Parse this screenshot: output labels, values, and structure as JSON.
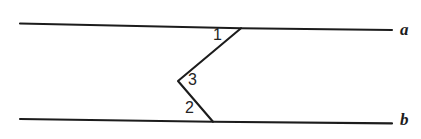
{
  "figure": {
    "background_color": "#ffffff",
    "stroke_color": "#1c1c1c",
    "stroke_width": 2.1,
    "width": 421,
    "height": 139,
    "lines": [
      {
        "name": "line-a",
        "label": "a",
        "label_style": "italic",
        "points": "20,23.5 241,28.2 392,30.0"
      },
      {
        "name": "line-b",
        "label": "b",
        "label_style": "italic",
        "points": "20,119.0 213,121.8 392,123.4"
      },
      {
        "name": "transversal-zigzag",
        "label": "",
        "label_style": "none",
        "points": "241,28.2 178,81.0 213,121.8"
      }
    ],
    "angles": [
      {
        "name": "angle-1",
        "label": "1",
        "vertex_x": 241,
        "vertex_y": 28
      },
      {
        "name": "angle-3",
        "label": "3",
        "vertex_x": 178,
        "vertex_y": 81
      },
      {
        "name": "angle-2",
        "label": "2",
        "vertex_x": 213,
        "vertex_y": 122
      }
    ]
  }
}
